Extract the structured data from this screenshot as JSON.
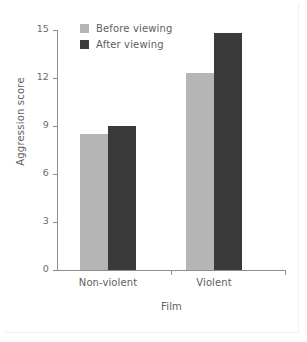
{
  "chart_data": {
    "type": "bar",
    "title": "",
    "subtitle": "",
    "xlabel": "Film",
    "ylabel": "Aggression score",
    "categories": [
      "Non-violent",
      "Violent"
    ],
    "series": [
      {
        "name": "Before viewing",
        "values": [
          8.5,
          12.3
        ],
        "color": "#b5b5b5"
      },
      {
        "name": "After viewing",
        "values": [
          9.0,
          14.8
        ],
        "color": "#3a3a3a"
      }
    ],
    "ylim": [
      0,
      15
    ],
    "yticks": [
      0,
      3,
      6,
      9,
      12,
      15
    ],
    "ytick_labels": [
      "0",
      "3",
      "6",
      "9",
      "12",
      "15"
    ],
    "grid": false,
    "legend_position": "top-left-inside",
    "annotations": []
  },
  "legend": {
    "items": [
      {
        "label": "Before viewing",
        "swatch": "legend-swatch-before"
      },
      {
        "label": "After viewing",
        "swatch": "legend-swatch-after"
      }
    ]
  },
  "axes": {
    "y_title": "Aggression score",
    "x_title": "Film",
    "y_labels": [
      "15",
      "12",
      "9",
      "6",
      "3",
      "0"
    ],
    "x_labels": [
      "Non-violent",
      "Violent"
    ]
  },
  "colors": {
    "before": "#b5b5b5",
    "after": "#3a3a3a",
    "axis": "#8d8d8d",
    "text": "#5e5e5e",
    "background": "#ffffff"
  }
}
